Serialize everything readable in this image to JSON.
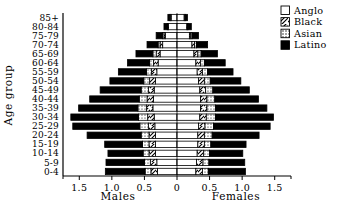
{
  "chart_data": {
    "type": "bar",
    "subtype": "population-pyramid",
    "title": "",
    "ylabel": "Age group",
    "xlabel_left": "Males",
    "xlabel_right": "Females",
    "xlim": [
      -1.75,
      1.75
    ],
    "grid": false,
    "legend_position": "top-right",
    "xticks_left": [
      "1.5",
      "1.0",
      "0.5"
    ],
    "xtick_center": "0",
    "xticks_right": [
      "0.5",
      "1.0",
      "1.5"
    ],
    "xtick_values": [
      -1.5,
      -1.0,
      -0.5,
      0,
      0.5,
      1.0,
      1.5
    ],
    "categories": [
      "0-4",
      "5-9",
      "10-14",
      "15-19",
      "20-24",
      "25-29",
      "30-34",
      "35-39",
      "40-44",
      "45-49",
      "50-54",
      "55-59",
      "60-64",
      "65-69",
      "70-74",
      "75-79",
      "80-84",
      "85+"
    ],
    "legend": [
      {
        "name": "Anglo",
        "fill": "empty"
      },
      {
        "name": "Black",
        "fill": "diagonal"
      },
      {
        "name": "Asian",
        "fill": "dotted"
      },
      {
        "name": "Latino",
        "fill": "solid"
      }
    ],
    "series": [
      {
        "name": "Anglo",
        "fill": "empty",
        "males": [
          0.3,
          0.31,
          0.33,
          0.33,
          0.33,
          0.34,
          0.35,
          0.37,
          0.36,
          0.35,
          0.33,
          0.31,
          0.29,
          0.26,
          0.22,
          0.18,
          0.13,
          0.09
        ],
        "females": [
          0.29,
          0.3,
          0.31,
          0.32,
          0.32,
          0.33,
          0.35,
          0.36,
          0.36,
          0.35,
          0.33,
          0.31,
          0.29,
          0.26,
          0.23,
          0.19,
          0.15,
          0.11
        ]
      },
      {
        "name": "Black",
        "fill": "diagonal",
        "males": [
          0.1,
          0.1,
          0.1,
          0.1,
          0.1,
          0.1,
          0.1,
          0.1,
          0.1,
          0.09,
          0.09,
          0.08,
          0.07,
          0.06,
          0.04,
          0.02,
          0.01,
          0.01
        ],
        "females": [
          0.1,
          0.1,
          0.1,
          0.1,
          0.1,
          0.1,
          0.1,
          0.1,
          0.1,
          0.09,
          0.09,
          0.08,
          0.07,
          0.06,
          0.04,
          0.02,
          0.01,
          0.01
        ]
      },
      {
        "name": "Asian",
        "fill": "dotted",
        "males": [
          0.09,
          0.09,
          0.09,
          0.1,
          0.12,
          0.13,
          0.14,
          0.13,
          0.12,
          0.11,
          0.09,
          0.08,
          0.06,
          0.05,
          0.03,
          0.02,
          0.01,
          0.01
        ],
        "females": [
          0.09,
          0.09,
          0.09,
          0.1,
          0.12,
          0.13,
          0.14,
          0.13,
          0.12,
          0.11,
          0.09,
          0.08,
          0.06,
          0.05,
          0.03,
          0.02,
          0.01,
          0.01
        ]
      },
      {
        "name": "Latino",
        "fill": "solid",
        "males": [
          0.61,
          0.59,
          0.54,
          0.58,
          0.83,
          1.03,
          1.04,
          0.91,
          0.76,
          0.63,
          0.52,
          0.43,
          0.34,
          0.26,
          0.17,
          0.1,
          0.05,
          0.03
        ],
        "females": [
          0.57,
          0.55,
          0.51,
          0.54,
          0.72,
          0.87,
          0.89,
          0.79,
          0.67,
          0.56,
          0.47,
          0.39,
          0.32,
          0.25,
          0.17,
          0.1,
          0.05,
          0.03
        ]
      }
    ]
  }
}
